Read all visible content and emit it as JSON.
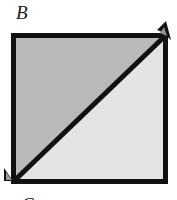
{
  "figure": {
    "label_top": "B",
    "label_bottom_partial": "C",
    "colors": {
      "upper_left_triangle": "#b9b9b9",
      "lower_right_triangle": "#e4e4e4",
      "outline": "#111111",
      "background": "#ffffff"
    },
    "geometry": {
      "square_left": 11,
      "square_top": 33,
      "square_right": 168,
      "square_bottom": 184,
      "outline_width": 5,
      "diagonal_from": "bottom-left",
      "diagonal_to": "top-right"
    },
    "marks": {
      "top_right_overshoot": "arrowhead-overshoot",
      "bottom_left_wedge": "corner-wedge"
    }
  }
}
